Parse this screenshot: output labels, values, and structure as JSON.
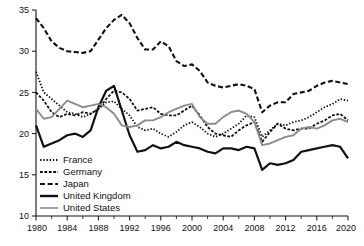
{
  "chart_data": {
    "type": "line",
    "title": "",
    "xlabel": "",
    "ylabel": "",
    "xlim": [
      1980,
      2020
    ],
    "ylim": [
      10,
      35
    ],
    "grid": false,
    "legend_position": "bottom-left",
    "x_ticks": [
      1980,
      1984,
      1988,
      1992,
      1996,
      2000,
      2004,
      2008,
      2012,
      2016,
      2020
    ],
    "x_minor_ticks": [
      1982,
      1986,
      1990,
      1994,
      1998,
      2002,
      2006,
      2010,
      2014,
      2018
    ],
    "y_ticks": [
      10,
      15,
      20,
      25,
      30,
      35
    ],
    "x": [
      1980,
      1981,
      1982,
      1983,
      1984,
      1985,
      1986,
      1987,
      1988,
      1989,
      1990,
      1991,
      1992,
      1993,
      1994,
      1995,
      1996,
      1997,
      1998,
      1999,
      2000,
      2001,
      2002,
      2003,
      2004,
      2005,
      2006,
      2007,
      2008,
      2009,
      2010,
      2011,
      2012,
      2013,
      2014,
      2015,
      2016,
      2017,
      2018,
      2019,
      2020
    ],
    "series": [
      {
        "name": "France",
        "color": "#111111",
        "style": "dotted",
        "width": 1.8,
        "dash": "1.4,1.8",
        "values": [
          27.5,
          25.0,
          24.2,
          23.4,
          22.6,
          22.4,
          22.0,
          22.4,
          23.0,
          23.8,
          23.9,
          23.0,
          22.2,
          20.8,
          20.4,
          20.6,
          20.0,
          19.6,
          20.2,
          21.0,
          21.4,
          20.8,
          20.0,
          19.6,
          20.0,
          20.6,
          21.2,
          22.2,
          22.0,
          19.6,
          20.4,
          21.2,
          21.0,
          21.4,
          21.6,
          22.0,
          22.6,
          23.2,
          23.6,
          24.2,
          24.0
        ]
      },
      {
        "name": "Germany",
        "color": "#111111",
        "style": "dashed-short",
        "width": 1.8,
        "dash": "2.8,1.6",
        "values": [
          25.0,
          24.0,
          22.6,
          22.0,
          22.4,
          22.2,
          22.6,
          22.4,
          23.0,
          24.2,
          25.2,
          25.0,
          24.2,
          22.8,
          23.0,
          23.2,
          22.4,
          22.2,
          22.2,
          22.8,
          23.4,
          22.2,
          20.8,
          20.0,
          19.8,
          19.6,
          20.4,
          21.0,
          21.4,
          19.0,
          20.2,
          21.2,
          20.6,
          20.4,
          20.6,
          20.6,
          21.2,
          21.6,
          22.2,
          22.4,
          21.6
        ]
      },
      {
        "name": "Japan",
        "color": "#111111",
        "style": "dashed-long",
        "width": 2.1,
        "dash": "5,2.6",
        "values": [
          34.0,
          32.8,
          31.2,
          30.4,
          30.0,
          29.9,
          29.8,
          30.0,
          31.4,
          32.8,
          33.8,
          34.4,
          33.4,
          31.6,
          30.2,
          30.2,
          31.2,
          30.6,
          28.8,
          28.2,
          28.4,
          27.6,
          26.2,
          25.8,
          25.6,
          25.8,
          26.0,
          25.8,
          25.4,
          22.6,
          23.4,
          23.8,
          23.8,
          24.8,
          25.0,
          25.2,
          25.8,
          26.2,
          26.4,
          26.2,
          26.0
        ]
      },
      {
        "name": "United Kingdom",
        "color": "#111111",
        "style": "solid",
        "width": 2.2,
        "dash": "",
        "values": [
          21.0,
          18.4,
          18.8,
          19.2,
          19.8,
          20.0,
          19.6,
          20.4,
          23.2,
          25.2,
          25.8,
          22.8,
          19.8,
          17.8,
          18.0,
          18.6,
          18.2,
          18.4,
          19.0,
          18.6,
          18.4,
          18.2,
          17.8,
          17.6,
          18.2,
          18.2,
          18.0,
          18.4,
          18.2,
          15.6,
          16.4,
          16.2,
          16.4,
          16.8,
          17.8,
          18.0,
          18.2,
          18.4,
          18.6,
          18.4,
          17.0
        ]
      },
      {
        "name": "United States",
        "color": "#8c8c8c",
        "style": "solid",
        "width": 1.9,
        "dash": "",
        "values": [
          23.0,
          21.8,
          22.0,
          23.0,
          24.0,
          23.6,
          23.2,
          23.4,
          23.6,
          23.2,
          22.4,
          21.0,
          20.8,
          21.0,
          21.6,
          21.6,
          22.0,
          22.6,
          23.0,
          23.4,
          23.6,
          22.0,
          21.2,
          21.2,
          22.0,
          22.6,
          22.8,
          22.4,
          21.4,
          18.6,
          18.8,
          19.2,
          19.6,
          19.8,
          20.6,
          20.8,
          20.6,
          21.0,
          21.6,
          21.8,
          21.4
        ]
      }
    ],
    "legend": [
      {
        "label": "France",
        "style": "dotted",
        "color": "#111111",
        "dash": "1.4,1.8",
        "width": 1.8
      },
      {
        "label": "Germany",
        "style": "dashed-short",
        "color": "#111111",
        "dash": "2.8,1.6",
        "width": 1.8
      },
      {
        "label": "Japan",
        "style": "dashed-long",
        "color": "#111111",
        "dash": "5,2.6",
        "width": 2.1
      },
      {
        "label": "United Kingdom",
        "style": "solid",
        "color": "#111111",
        "dash": "",
        "width": 2.4
      },
      {
        "label": "United States",
        "style": "solid",
        "color": "#8c8c8c",
        "dash": "",
        "width": 1.6
      }
    ]
  },
  "layout": {
    "plot_left": 36,
    "plot_right": 348,
    "plot_top": 10,
    "plot_bottom": 216,
    "legend_x": 36,
    "legend_y": 160,
    "legend_line_len": 18,
    "legend_row_height": 12
  }
}
